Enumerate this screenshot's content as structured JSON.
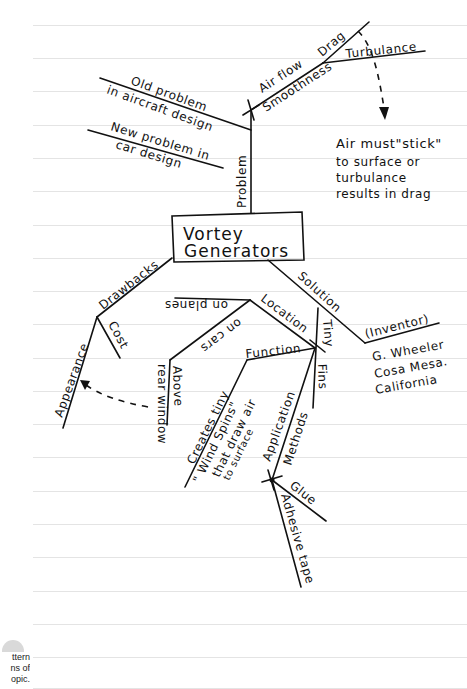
{
  "page": {
    "type": "handwritten mind map on lined notebook paper",
    "line_color": "#e4e4e4",
    "ink_color": "#111111",
    "rule_y": [
      25,
      58,
      91,
      125,
      158,
      191,
      225,
      258,
      291,
      324,
      358,
      391,
      424,
      457,
      491,
      524,
      557,
      591,
      624,
      657,
      689
    ]
  },
  "central_node": {
    "line1": "Vortex",
    "line2": "Generators",
    "line1_as_written": "Vortey"
  },
  "branches": {
    "problem": {
      "label": "Problem",
      "sub": {
        "old": [
          "Old problem",
          "in aircraft design"
        ],
        "new": [
          "New problem in",
          "car design"
        ],
        "airflow": "Air flow",
        "smoothness": "Smoothness",
        "drag": "Drag",
        "turbulance": "Turbulance"
      },
      "note": [
        "Air must\"stick\"",
        "to surface or",
        "turbulance",
        "results in drag"
      ]
    },
    "drawbacks": {
      "label": "Drawbacks",
      "sub": {
        "appearance": "Appearance",
        "cost": "Cost"
      }
    },
    "solution": {
      "label": "Solution",
      "inventor_label": "(Inventor)",
      "inventor": [
        "G. Wheeler",
        "Cosa Mesa.",
        "California"
      ],
      "tiny": "Tiny",
      "fins": "Fins",
      "location": {
        "label": "Location",
        "on_planes": "on planes",
        "on_cars": "on cars",
        "above": "Above",
        "rear_window": "rear window"
      },
      "function": {
        "label": "Function",
        "text": [
          "Creates tiny",
          "\" Wind Spins\"",
          "that draw air",
          "to surface"
        ]
      },
      "application": {
        "label": "Application",
        "methods": "Methods",
        "glue": "Glue",
        "adhesive_tape": "Adhesive tape"
      }
    }
  },
  "caption": [
    "ttern",
    "ns of",
    "opic."
  ]
}
